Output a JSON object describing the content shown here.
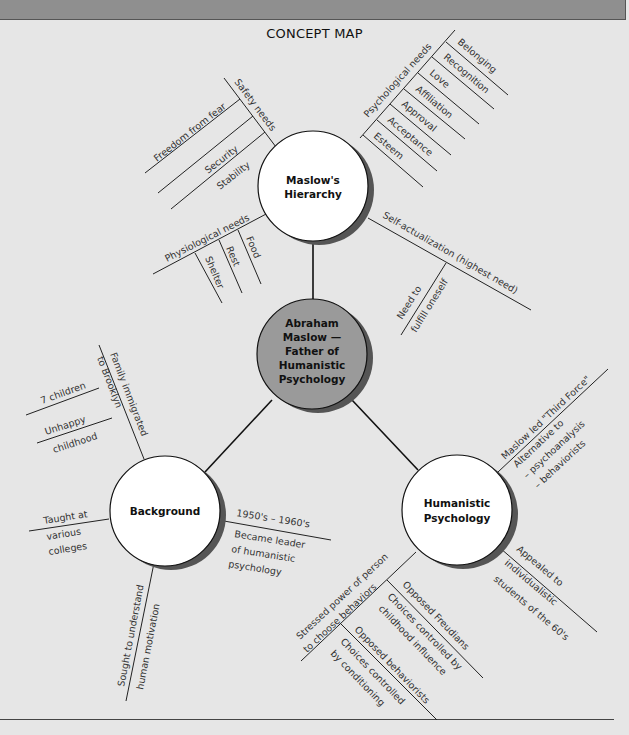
{
  "title": "CONCEPT MAP",
  "colors": {
    "background": "#e6e6e6",
    "topbar": "#8f8f8f",
    "center_node": "#9a9a9a",
    "outer_node": "#ffffff",
    "shadow": "#555555"
  },
  "nodes": {
    "center": {
      "line1": "Abraham",
      "line2": "Maslow —",
      "line3": "Father of",
      "line4": "Humanistic",
      "line5": "Psychology"
    },
    "maslow": {
      "line1": "Maslow's",
      "line2": "Hierarchy"
    },
    "background": {
      "line1": "Background"
    },
    "humanistic": {
      "line1": "Humanistic",
      "line2": "Psychology"
    }
  },
  "maslow_branches": {
    "safety": {
      "label": "Safety needs",
      "items": [
        "Freedom from fear",
        "Security",
        "Stability"
      ]
    },
    "psychological": {
      "label": "Psychological needs",
      "items": [
        "Belonging",
        "Recognition",
        "Love",
        "Affiliation",
        "Approval",
        "Acceptance",
        "Esteem"
      ]
    },
    "physiological": {
      "label": "Physiological needs",
      "items": [
        "Food",
        "Rest",
        "Shelter"
      ]
    },
    "self_actualization": {
      "label": "Self-actualization (highest need)",
      "sub_line1": "Need to",
      "sub_line2": "fulfill oneself"
    }
  },
  "background_branches": {
    "family": {
      "line1": "Family immigrated",
      "line2": "to Brooklyn"
    },
    "children": "7 children",
    "unhappy": {
      "line1": "Unhappy",
      "line2": "childhood"
    },
    "taught": {
      "line1": "Taught at",
      "line2": "various",
      "line3": "colleges"
    },
    "era": {
      "line1": "1950's – 1960's",
      "line2": "Became leader",
      "line3": "of humanistic",
      "line4": "psychology"
    },
    "motivation": {
      "line1": "Sought to understand",
      "line2": "human motivation"
    }
  },
  "humanistic_branches": {
    "third_force": {
      "line1": "Maslow led \"Third Force\"",
      "line2": "Alternative to",
      "line3": "– psychoanalysis",
      "line4": "– behaviorists"
    },
    "appealed": {
      "line1": "Appealed to",
      "line2": "individualistic",
      "line3": "students of the 60's"
    },
    "stressed": {
      "line1": "Stressed power of person",
      "line2": "to choose behaviors"
    },
    "freudians": {
      "line1": "Opposed Freudians",
      "line2": "Choices controlled by",
      "line3": "childhood influence"
    },
    "behaviorists": {
      "line1": "Opposed behaviorists",
      "line2": "Choices controlled",
      "line3": "by conditioning"
    }
  }
}
